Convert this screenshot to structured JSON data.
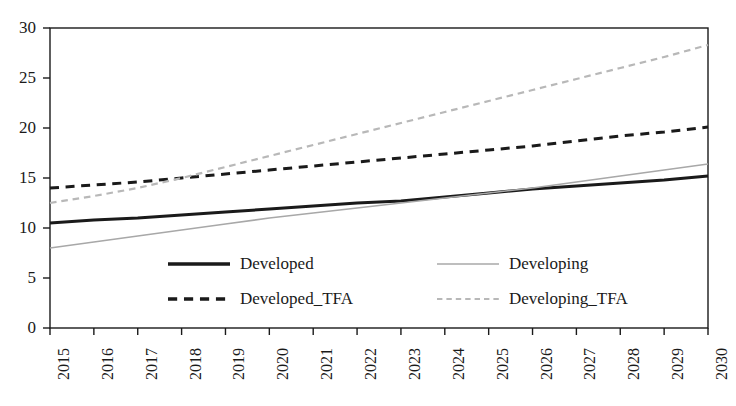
{
  "chart_data": {
    "type": "line",
    "title": "",
    "xlabel": "",
    "ylabel": "",
    "x": [
      2015,
      2016,
      2017,
      2018,
      2019,
      2020,
      2021,
      2022,
      2023,
      2024,
      2025,
      2026,
      2027,
      2028,
      2029,
      2030
    ],
    "categories": [
      "2015",
      "2016",
      "2017",
      "2018",
      "2019",
      "2020",
      "2021",
      "2022",
      "2023",
      "2024",
      "2025",
      "2026",
      "2027",
      "2028",
      "2029",
      "2030"
    ],
    "xlim": [
      2015,
      2030
    ],
    "ylim": [
      0,
      30
    ],
    "yticks": [
      0,
      5,
      10,
      15,
      20,
      25,
      30
    ],
    "ytick_labels": [
      "0",
      "5",
      "10",
      "15",
      "20",
      "25",
      "30"
    ],
    "grid": false,
    "legend_position": "inside-bottom-center",
    "series": [
      {
        "name": "Developed",
        "style": "solid",
        "color": "#1a1a1a",
        "width": 3.0,
        "values": [
          10.5,
          10.8,
          11.0,
          11.3,
          11.6,
          11.9,
          12.2,
          12.5,
          12.7,
          13.1,
          13.5,
          13.9,
          14.2,
          14.5,
          14.8,
          15.2
        ]
      },
      {
        "name": "Developing",
        "style": "solid",
        "color": "#a8a8a8",
        "width": 1.6,
        "values": [
          8.0,
          8.6,
          9.2,
          9.8,
          10.4,
          11.0,
          11.5,
          12.0,
          12.5,
          13.0,
          13.5,
          14.0,
          14.6,
          15.2,
          15.8,
          16.4
        ]
      },
      {
        "name": "Developed_TFA",
        "style": "dashed",
        "color": "#1a1a1a",
        "width": 3.0,
        "values": [
          14.0,
          14.3,
          14.6,
          15.0,
          15.4,
          15.8,
          16.2,
          16.6,
          17.0,
          17.4,
          17.8,
          18.2,
          18.7,
          19.2,
          19.6,
          20.1
        ]
      },
      {
        "name": "Developing_TFA",
        "style": "dashed",
        "color": "#b8b8b8",
        "width": 2.2,
        "values": [
          12.5,
          13.2,
          14.0,
          15.0,
          16.1,
          17.2,
          18.3,
          19.4,
          20.5,
          21.6,
          22.7,
          23.8,
          24.9,
          26.0,
          27.1,
          28.3
        ]
      }
    ],
    "legend": [
      {
        "label": "Developed",
        "style": "solid",
        "color": "#1a1a1a",
        "width": 3.4
      },
      {
        "label": "Developing",
        "style": "solid",
        "color": "#a8a8a8",
        "width": 1.6
      },
      {
        "label": "Developed_TFA",
        "style": "dashed",
        "color": "#1a1a1a",
        "width": 3.4
      },
      {
        "label": "Developing_TFA",
        "style": "dashed",
        "color": "#b8b8b8",
        "width": 2.0
      }
    ],
    "axis_color": "#1a1a1a"
  }
}
